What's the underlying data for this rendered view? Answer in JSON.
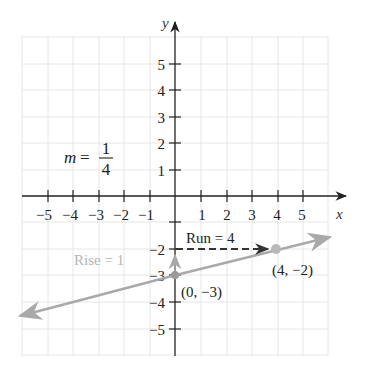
{
  "figure": {
    "type": "coordinate-plane-slope-diagram",
    "axes": {
      "x_label": "x",
      "y_label": "y",
      "x_ticks": [
        "−5",
        "−4",
        "−3",
        "−2",
        "−1",
        "1",
        "2",
        "3",
        "4",
        "5"
      ],
      "y_ticks_pos": [
        "5",
        "4",
        "3",
        "2",
        "1"
      ],
      "y_ticks_neg": [
        "−2",
        "−3",
        "−4",
        "−5"
      ]
    },
    "slope": {
      "m_label": "m =",
      "numerator": "1",
      "denominator": "4"
    },
    "points": [
      {
        "label": "(0, −3)",
        "x": 0,
        "y": -3
      },
      {
        "label": "(4, −2)",
        "x": 4,
        "y": -2
      }
    ],
    "annotations": {
      "run": "Run = 4",
      "rise": "Rise = 1"
    },
    "line": {
      "equation": "y = (1/4)x − 3",
      "color": "#a9a9a9"
    },
    "colors": {
      "axis": "#222222",
      "grid": "#e6e6e6",
      "line": "#a9a9a9",
      "point": "#b0b0b0",
      "rise_text": "#b5b5b5",
      "run_arrow": "#333333"
    }
  }
}
